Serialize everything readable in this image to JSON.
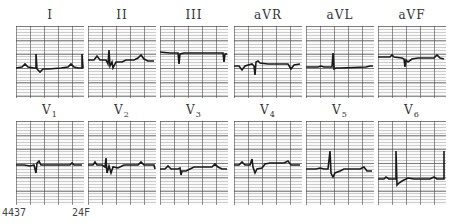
{
  "figure": {
    "type": "12-lead ECG",
    "rows": [
      {
        "leads": [
          {
            "name": "I",
            "label_main": "I",
            "label_sub": ""
          },
          {
            "name": "II",
            "label_main": "II",
            "label_sub": ""
          },
          {
            "name": "III",
            "label_main": "III",
            "label_sub": ""
          },
          {
            "name": "aVR",
            "label_main": "aVR",
            "label_sub": ""
          },
          {
            "name": "aVL",
            "label_main": "aVL",
            "label_sub": ""
          },
          {
            "name": "aVF",
            "label_main": "aVF",
            "label_sub": ""
          }
        ]
      },
      {
        "leads": [
          {
            "name": "V1",
            "label_main": "V",
            "label_sub": "1"
          },
          {
            "name": "V2",
            "label_main": "V",
            "label_sub": "2"
          },
          {
            "name": "V3",
            "label_main": "V",
            "label_sub": "3"
          },
          {
            "name": "V4",
            "label_main": "V",
            "label_sub": "4"
          },
          {
            "name": "V5",
            "label_main": "V",
            "label_sub": "5"
          },
          {
            "name": "V6",
            "label_main": "V",
            "label_sub": "6"
          }
        ]
      }
    ],
    "footer": {
      "id": "4437",
      "patient": "24F"
    },
    "trace_color": "#1a1a1a",
    "grid_color": "#555555"
  }
}
